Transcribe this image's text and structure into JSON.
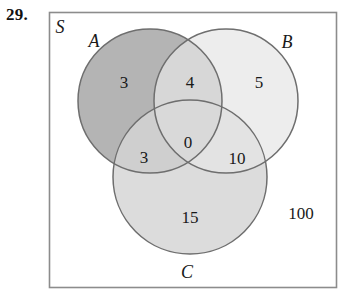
{
  "problem": {
    "number": "29."
  },
  "diagram": {
    "type": "venn-diagram-three-sets",
    "universe_label": "S",
    "sets": [
      {
        "id": "A",
        "label": "A",
        "fill": "#b4b4b4"
      },
      {
        "id": "B",
        "label": "B",
        "fill": "#ededed"
      },
      {
        "id": "C",
        "label": "C",
        "fill": "#dcdcdc"
      }
    ],
    "stroke_color": "#6e6e6e",
    "border_color": "#8c8c8c",
    "regions": [
      {
        "id": "A-only",
        "label": "3",
        "description": "in A only"
      },
      {
        "id": "A-and-B",
        "label": "4",
        "description": "in A and B only"
      },
      {
        "id": "B-only",
        "label": "5",
        "description": "in B only"
      },
      {
        "id": "A-and-C",
        "label": "3",
        "description": "in A and C only"
      },
      {
        "id": "A-B-C",
        "label": "0",
        "description": "in A, B and C"
      },
      {
        "id": "B-and-C",
        "label": "10",
        "description": "in B and C only"
      },
      {
        "id": "C-only",
        "label": "15",
        "description": "in C only"
      },
      {
        "id": "outside",
        "label": "100",
        "description": "outside all sets"
      }
    ]
  }
}
